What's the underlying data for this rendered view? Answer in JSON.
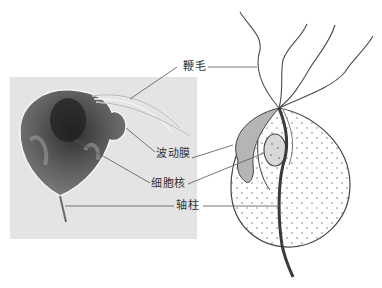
{
  "figure": {
    "panels": [
      "micrograph",
      "line-drawing"
    ],
    "labels": [
      {
        "id": "flagella",
        "text": "鞭毛"
      },
      {
        "id": "undulating-membrane",
        "text": "波动膜"
      },
      {
        "id": "nucleus",
        "text": "细胞核"
      },
      {
        "id": "axostyle",
        "text": "轴柱"
      }
    ]
  },
  "colors": {
    "photo_bg": "#e4e4e4",
    "cell_dark": "#3a3a3a",
    "line": "#555555",
    "drawing_stroke": "#444444"
  }
}
